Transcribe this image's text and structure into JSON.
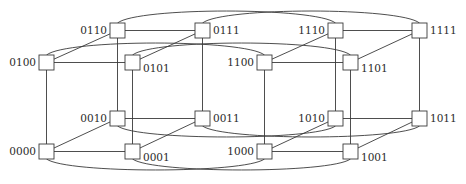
{
  "diagram": {
    "node_size": 15,
    "nodes": [
      {
        "id": "0110",
        "label": "0110",
        "x": 110,
        "y": 23,
        "label_side": "left"
      },
      {
        "id": "0111",
        "label": "0111",
        "x": 195,
        "y": 23,
        "label_side": "right"
      },
      {
        "id": "1110",
        "label": "1110",
        "x": 328,
        "y": 23,
        "label_side": "left"
      },
      {
        "id": "1111",
        "label": "1111",
        "x": 412,
        "y": 23,
        "label_side": "right"
      },
      {
        "id": "0100",
        "label": "0100",
        "x": 39,
        "y": 55,
        "label_side": "left"
      },
      {
        "id": "0101",
        "label": "0101",
        "x": 125,
        "y": 55,
        "label_side": "right-low"
      },
      {
        "id": "1100",
        "label": "1100",
        "x": 257,
        "y": 55,
        "label_side": "left"
      },
      {
        "id": "1101",
        "label": "1101",
        "x": 343,
        "y": 55,
        "label_side": "right-low"
      },
      {
        "id": "0010",
        "label": "0010",
        "x": 110,
        "y": 111,
        "label_side": "left"
      },
      {
        "id": "0011",
        "label": "0011",
        "x": 195,
        "y": 111,
        "label_side": "right"
      },
      {
        "id": "1010",
        "label": "1010",
        "x": 328,
        "y": 111,
        "label_side": "left"
      },
      {
        "id": "1011",
        "label": "1011",
        "x": 412,
        "y": 111,
        "label_side": "right"
      },
      {
        "id": "0000",
        "label": "0000",
        "x": 39,
        "y": 144,
        "label_side": "left"
      },
      {
        "id": "0001",
        "label": "0001",
        "x": 125,
        "y": 144,
        "label_side": "right-low"
      },
      {
        "id": "1000",
        "label": "1000",
        "x": 257,
        "y": 144,
        "label_side": "left"
      },
      {
        "id": "1001",
        "label": "1001",
        "x": 343,
        "y": 144,
        "label_side": "right-low"
      }
    ],
    "edges_straight": [
      [
        "0110",
        "0111"
      ],
      [
        "0100",
        "0101"
      ],
      [
        "0010",
        "0011"
      ],
      [
        "0000",
        "0001"
      ],
      [
        "1110",
        "1111"
      ],
      [
        "1100",
        "1101"
      ],
      [
        "1010",
        "1011"
      ],
      [
        "1000",
        "1001"
      ],
      [
        "0100",
        "0110"
      ],
      [
        "0101",
        "0111"
      ],
      [
        "0000",
        "0010"
      ],
      [
        "0001",
        "0011"
      ],
      [
        "1100",
        "1110"
      ],
      [
        "1101",
        "1111"
      ],
      [
        "1000",
        "1010"
      ],
      [
        "1001",
        "1011"
      ],
      [
        "0100",
        "0000"
      ],
      [
        "0101",
        "0001"
      ],
      [
        "0110",
        "0010"
      ],
      [
        "0111",
        "0011"
      ],
      [
        "1100",
        "1000"
      ],
      [
        "1101",
        "1001"
      ],
      [
        "1110",
        "1010"
      ],
      [
        "1111",
        "1011"
      ]
    ],
    "edges_curved": [
      {
        "from": "0110",
        "to": "1110",
        "side": "top"
      },
      {
        "from": "0111",
        "to": "1111",
        "side": "top"
      },
      {
        "from": "0100",
        "to": "1100",
        "side": "top"
      },
      {
        "from": "0101",
        "to": "1101",
        "side": "top"
      },
      {
        "from": "0010",
        "to": "1010",
        "side": "bottom"
      },
      {
        "from": "0011",
        "to": "1011",
        "side": "bottom"
      },
      {
        "from": "0000",
        "to": "1000",
        "side": "bottom"
      },
      {
        "from": "0001",
        "to": "1001",
        "side": "bottom"
      }
    ]
  }
}
